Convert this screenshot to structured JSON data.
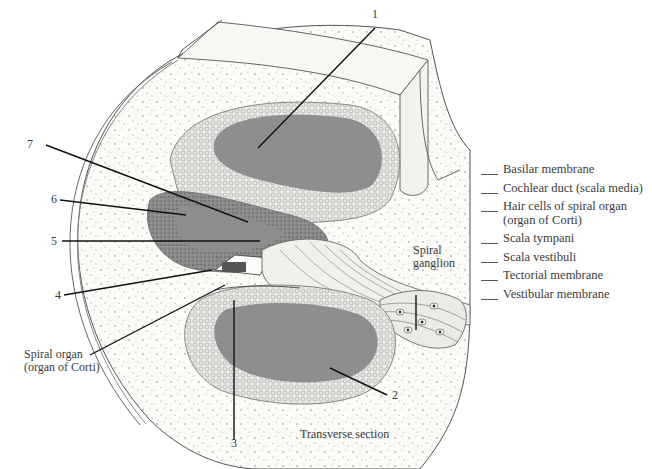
{
  "figure": {
    "title": "Transverse section",
    "colors": {
      "background": "#ffffff",
      "cavity_fill": "#8e8e8e",
      "bone_stipple": "#f4f4f0",
      "line": "#222222"
    }
  },
  "callouts": {
    "n1": "1",
    "n2": "2",
    "n3": "3",
    "n4": "4",
    "n5": "5",
    "n6": "6",
    "n7": "7"
  },
  "named_labels": {
    "spiral_ganglion": "Spiral\nganglion",
    "spiral_organ": "Spiral organ\n(organ of Corti)",
    "section_caption": "Transverse section"
  },
  "legend": {
    "items": [
      {
        "text": "Basilar membrane"
      },
      {
        "text": "Cochlear duct (scala media)"
      },
      {
        "text": "Hair cells of spiral organ\n(organ of Corti)"
      },
      {
        "text": "Scala tympani"
      },
      {
        "text": "Scala vestibuli"
      },
      {
        "text": "Tectorial membrane"
      },
      {
        "text": "Vestibular membrane"
      }
    ]
  }
}
